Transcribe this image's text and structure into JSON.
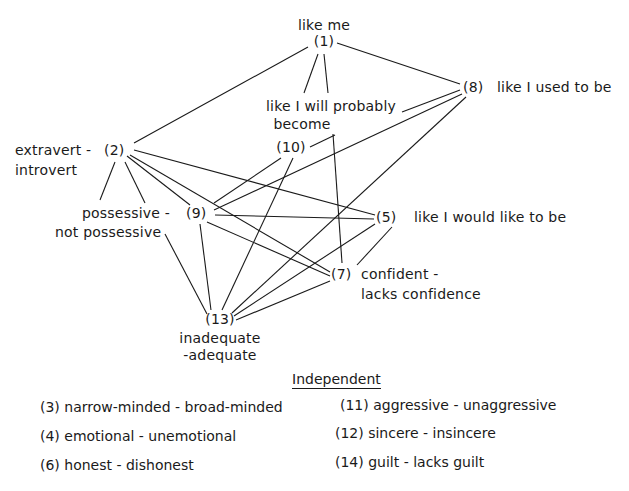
{
  "diagram": {
    "type": "graph",
    "nodes": [
      {
        "id": "1",
        "number": "(1)",
        "label": "like me"
      },
      {
        "id": "2",
        "number": "(2)",
        "label_left": "extravert -",
        "label_below": "introvert"
      },
      {
        "id": "5",
        "number": "(5)",
        "label": "like I would like to be"
      },
      {
        "id": "7",
        "number": "(7)",
        "label_right": "confident -",
        "label_below": "lacks confidence"
      },
      {
        "id": "8",
        "number": "(8)",
        "label": "like I used to be"
      },
      {
        "id": "9",
        "number": "(9)",
        "label_left": "possessive -",
        "label_below": "not possessive"
      },
      {
        "id": "10",
        "number": "(10)",
        "label_line1": "like I will probably",
        "label_line2": "become"
      },
      {
        "id": "13",
        "number": "(13)",
        "label_line1": "inadequate",
        "label_line2": "-adequate"
      }
    ],
    "edges": [
      [
        "1",
        "2"
      ],
      [
        "1",
        "8"
      ],
      [
        "1",
        "10"
      ],
      [
        "1",
        "7"
      ],
      [
        "8",
        "10"
      ],
      [
        "8",
        "9"
      ],
      [
        "8",
        "13"
      ],
      [
        "2",
        "9"
      ],
      [
        "2",
        "13"
      ],
      [
        "2",
        "5"
      ],
      [
        "2",
        "7"
      ],
      [
        "10",
        "9"
      ],
      [
        "10",
        "13"
      ],
      [
        "9",
        "5"
      ],
      [
        "9",
        "7"
      ],
      [
        "9",
        "13"
      ],
      [
        "5",
        "7"
      ],
      [
        "5",
        "13"
      ],
      [
        "7",
        "13"
      ]
    ]
  },
  "legend": {
    "title": "Independent",
    "items": [
      {
        "text": "(3) narrow-minded - broad-minded"
      },
      {
        "text": "(4) emotional - unemotional"
      },
      {
        "text": "(6) honest - dishonest"
      },
      {
        "text": "(11) aggressive - unaggressive"
      },
      {
        "text": "(12) sincere - insincere"
      },
      {
        "text": "(14) guilt - lacks guilt"
      }
    ]
  }
}
